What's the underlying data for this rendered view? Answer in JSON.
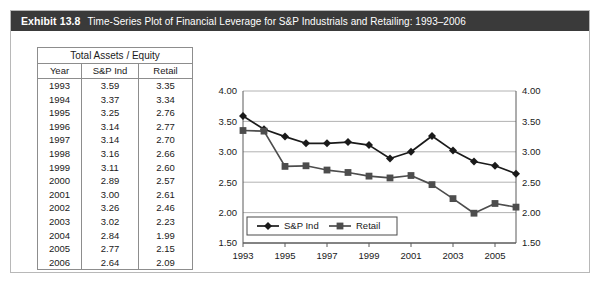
{
  "exhibit": {
    "number": "Exhibit 13.8",
    "title": "Time-Series Plot of Financial Leverage for S&P Industrials and Retailing: 1993–2006"
  },
  "table": {
    "group_header": "Total Assets / Equity",
    "columns": [
      "Year",
      "S&P Ind",
      "Retail"
    ],
    "rows": [
      [
        "1993",
        "3.59",
        "3.35"
      ],
      [
        "1994",
        "3.37",
        "3.34"
      ],
      [
        "1995",
        "3.25",
        "2.76"
      ],
      [
        "1996",
        "3.14",
        "2.77"
      ],
      [
        "1997",
        "3.14",
        "2.70"
      ],
      [
        "1998",
        "3.16",
        "2.66"
      ],
      [
        "1999",
        "3.11",
        "2.60"
      ],
      [
        "2000",
        "2.89",
        "2.57"
      ],
      [
        "2001",
        "3.00",
        "2.61"
      ],
      [
        "2002",
        "3.26",
        "2.46"
      ],
      [
        "2003",
        "3.02",
        "2.23"
      ],
      [
        "2004",
        "2.84",
        "1.99"
      ],
      [
        "2005",
        "2.77",
        "2.15"
      ],
      [
        "2006",
        "2.64",
        "2.09"
      ]
    ]
  },
  "chart_data": {
    "type": "line",
    "title": "",
    "xlabel": "",
    "ylabel": "",
    "x": [
      1993,
      1994,
      1995,
      1996,
      1997,
      1998,
      1999,
      2000,
      2001,
      2002,
      2003,
      2004,
      2005,
      2006
    ],
    "xtick_labels": [
      "1993",
      "1995",
      "1997",
      "1999",
      "2001",
      "2003",
      "2005"
    ],
    "xticks": [
      1993,
      1995,
      1997,
      1999,
      2001,
      2003,
      2005
    ],
    "ylim": [
      1.5,
      4.0
    ],
    "ytick_labels": [
      "1.50",
      "2.00",
      "2.50",
      "3.00",
      "3.50",
      "4.00"
    ],
    "yticks": [
      1.5,
      2.0,
      2.5,
      3.0,
      3.5,
      4.0
    ],
    "grid": true,
    "dual_y_axis": true,
    "legend_position": "bottom-left",
    "series": [
      {
        "name": "S&P Ind",
        "marker": "diamond",
        "color": "#1a1a1a",
        "values": [
          3.59,
          3.37,
          3.25,
          3.14,
          3.14,
          3.16,
          3.11,
          2.89,
          3.0,
          3.26,
          3.02,
          2.84,
          2.77,
          2.64
        ]
      },
      {
        "name": "Retail",
        "marker": "square",
        "color": "#4d4d4d",
        "values": [
          3.35,
          3.34,
          2.76,
          2.77,
          2.7,
          2.66,
          2.6,
          2.57,
          2.61,
          2.46,
          2.23,
          1.99,
          2.15,
          2.09
        ]
      }
    ]
  }
}
